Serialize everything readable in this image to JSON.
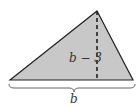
{
  "figure": {
    "shape": "triangle",
    "fill_color": "#c8c8c8",
    "stroke_color": "#222222",
    "height_label": "b − 3",
    "base_label": "b"
  }
}
